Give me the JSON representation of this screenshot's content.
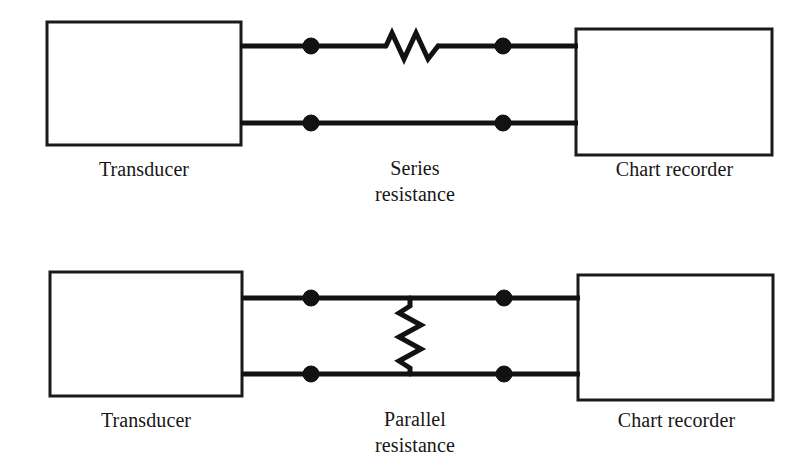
{
  "figure": {
    "kind": "electrical-circuit-diagram",
    "background_color": "#ffffff",
    "ink_color": "#121212",
    "width": 811,
    "height": 476
  },
  "circuits": [
    {
      "id": "series-circuit",
      "source_label": "Transducer",
      "element_label_line1": "Series",
      "element_label_line2": "resistance",
      "element_label": "Series resistance",
      "sink_label": "Chart recorder",
      "resistor_orientation": "horizontal",
      "resistor_position": "in-series-top-wire",
      "node_count": 4
    },
    {
      "id": "parallel-circuit",
      "source_label": "Transducer",
      "element_label_line1": "Parallel",
      "element_label_line2": "resistance",
      "element_label": "Parallel resistance",
      "sink_label": "Chart recorder",
      "resistor_orientation": "vertical",
      "resistor_position": "bridging-both-wires",
      "node_count": 4
    }
  ]
}
